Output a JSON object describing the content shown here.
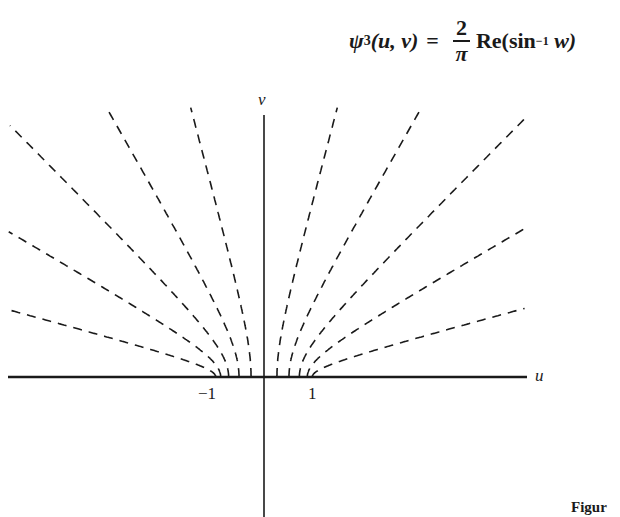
{
  "formula": {
    "lhs": "ψ",
    "subscript": "3",
    "args": "(u, v)",
    "equals": "=",
    "fraction_numerator": "2",
    "fraction_denominator": "π",
    "rhs_prefix": "Re(sin",
    "superscript": "−1",
    "rhs_suffix": "w)"
  },
  "axes": {
    "u_label": "u",
    "v_label": "v",
    "tick_neg_one": "−1",
    "tick_pos_one": "1"
  },
  "caption": "Figur",
  "diagram": {
    "origin_px": [
      264,
      377
    ],
    "unit_px": 50,
    "level_angles_deg": [
      15,
      30,
      45,
      60,
      75
    ],
    "line_color": "#1a1a1a",
    "dash": "9 7"
  }
}
